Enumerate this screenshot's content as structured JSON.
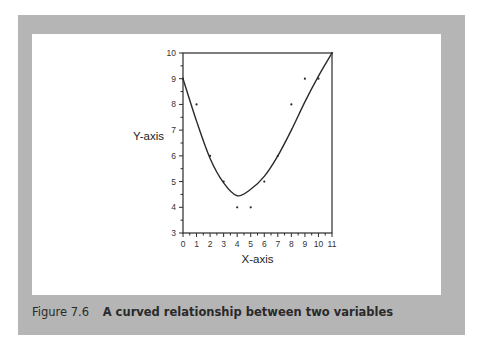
{
  "figure": {
    "number": "Figure 7.6",
    "title": "A curved relationship between two variables"
  },
  "colors": {
    "panel": "#b5b5b5",
    "plot_bg": "#ffffff",
    "ink": "#2a2a2a"
  },
  "chart_data": {
    "type": "scatter",
    "title": "A curved relationship between two variables",
    "xlabel": "X-axis",
    "ylabel": "Y-axis",
    "xlim": [
      0,
      11
    ],
    "ylim": [
      3,
      10
    ],
    "x_ticks": [
      0,
      1,
      2,
      3,
      4,
      5,
      6,
      7,
      8,
      9,
      10,
      11
    ],
    "y_ticks": [
      3,
      4,
      5,
      6,
      7,
      8,
      9,
      10
    ],
    "minor_ticks": "half-unit on both axes",
    "grid": false,
    "legend": null,
    "series": [
      {
        "name": "observations",
        "kind": "points",
        "x": [
          0,
          1,
          2,
          3,
          4,
          5,
          6,
          7,
          8,
          9,
          10,
          11
        ],
        "y": [
          9,
          8,
          6,
          5,
          4,
          4,
          5,
          6,
          8,
          9,
          9,
          10
        ]
      },
      {
        "name": "fitted curve",
        "kind": "line",
        "description": "U-shaped quadratic fit, minimum near x=4, y≈4.45",
        "x": [
          0,
          1,
          2,
          3,
          4,
          5,
          6,
          7,
          8,
          9,
          10,
          11
        ],
        "y": [
          9.0,
          7.35,
          5.9,
          4.95,
          4.45,
          4.7,
          5.2,
          6.0,
          7.0,
          8.1,
          9.1,
          10.0
        ]
      }
    ]
  }
}
